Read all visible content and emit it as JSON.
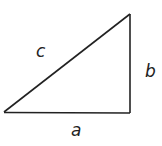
{
  "diagram": {
    "type": "right-triangle",
    "vertices": {
      "left": [
        4,
        112
      ],
      "top_right": [
        130,
        14
      ],
      "bottom_right": [
        130,
        113
      ]
    },
    "stroke_color": "#222222",
    "labels": {
      "hypotenuse": "c",
      "vertical_leg": "b",
      "horizontal_leg": "a"
    }
  }
}
